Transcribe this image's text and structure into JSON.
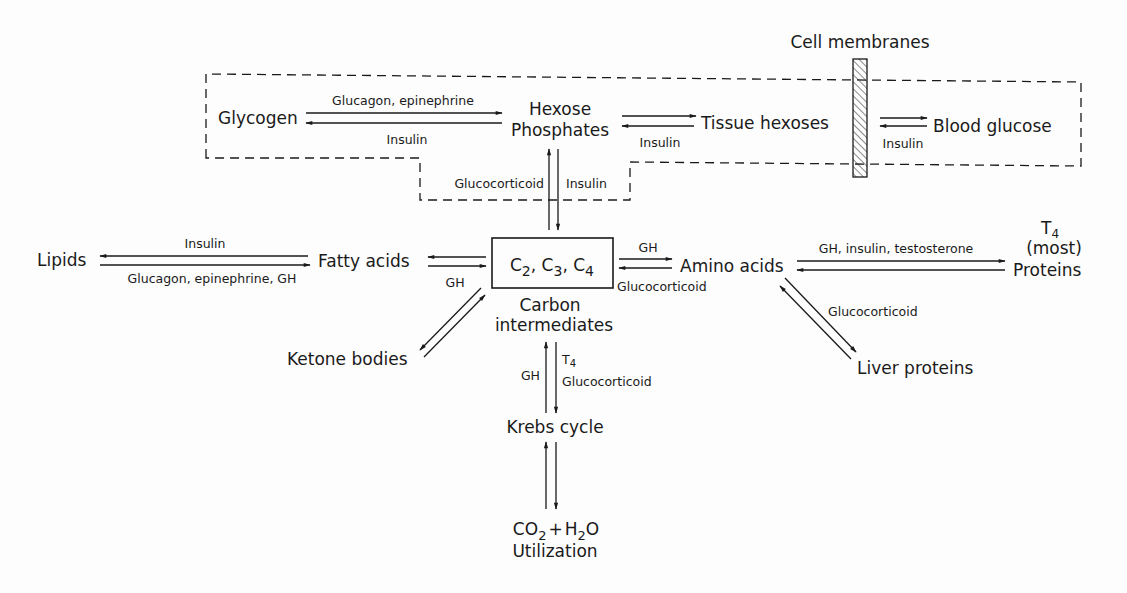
{
  "diagram": {
    "type": "metabolic-pathway",
    "nodes": {
      "glycogen": "Glycogen",
      "hexose_1": "Hexose",
      "hexose_2": "Phosphates",
      "tissue_hexoses": "Tissue hexoses",
      "blood_glucose": "Blood glucose",
      "cell_membranes": "Cell membranes",
      "lipids": "Lipids",
      "fatty_acids": "Fatty acids",
      "carbon_box": {
        "c": "C",
        "s2": "2",
        "s3": "3",
        "s4": "4",
        "sep": ", "
      },
      "carbon_1": "Carbon",
      "carbon_2": "intermediates",
      "amino_acids": "Amino acids",
      "proteins": "Proteins",
      "proteins_t": "T",
      "proteins_t_sub": "4",
      "proteins_most": "(most)",
      "ketone_bodies": "Ketone bodies",
      "liver_proteins": "Liver proteins",
      "krebs": "Krebs cycle",
      "co2_c": "CO",
      "co2_sub": "2",
      "plus": "+",
      "h2o_h": "H",
      "h2o_sub": "2",
      "h2o_o": "O",
      "utilization": "Utilization"
    },
    "edges": {
      "glycogen_forward": "Glucagon, epinephrine",
      "glycogen_reverse": "Insulin",
      "hexose_tissue": "Insulin",
      "tissue_blood": "Insulin",
      "hexose_down": "Glucocorticoid",
      "hexose_up": "Insulin",
      "lipids_top": "Insulin",
      "lipids_bottom": "Glucagon, epinephrine, GH",
      "fatty_gh": "GH",
      "amino_top": "GH",
      "amino_bottom": "Glucocorticoid",
      "proteins_top": "GH, insulin, testosterone",
      "liver": "Glucocorticoid",
      "krebs_left": "GH",
      "krebs_t": "T",
      "krebs_t_sub": "4",
      "krebs_right": "Glucocorticoid"
    }
  }
}
